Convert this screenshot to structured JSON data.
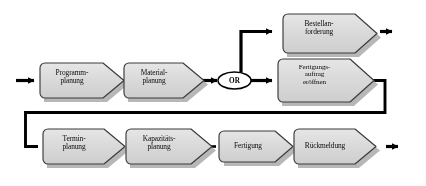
{
  "diagram": {
    "type": "process-flow-chart",
    "language": "de",
    "colors": {
      "box_fill": "#d6d6d6",
      "box_fill_top": "#e4e4e4",
      "box_border": "#3a3a3a",
      "shadow": "#aaaaaa",
      "line": "#000000",
      "text": "#0b0b0b",
      "background": "#ffffff"
    },
    "rows": {
      "top": {
        "steps": [
          {
            "id": "bestellanforderung",
            "label": "Bestellan-\nforderung",
            "lines": 2
          }
        ]
      },
      "middle": {
        "steps": [
          {
            "id": "programmplanung",
            "label": "Programm-\nplanung",
            "lines": 2
          },
          {
            "id": "materialplanung",
            "label": "Material-\nplanung",
            "lines": 2
          },
          {
            "id": "fertigungsauftrag",
            "label": "Fertigungs-\nauftrag\neröffnen",
            "lines": 3
          }
        ]
      },
      "bottom": {
        "steps": [
          {
            "id": "terminplanung",
            "label": "Termin-\nplanung",
            "lines": 2
          },
          {
            "id": "kapazitaetsplanung",
            "label": "Kapazitäts-\nplanung",
            "lines": 2
          },
          {
            "id": "fertigung",
            "label": "Fertigung",
            "lines": 1
          },
          {
            "id": "rueckmeldung",
            "label": "Rückmeldung",
            "lines": 1
          }
        ]
      }
    },
    "connectors": [
      {
        "id": "or-gate",
        "label": "OR",
        "shape": "ellipse"
      }
    ],
    "arrows": [
      {
        "id": "input-arrow",
        "name": "process-start-arrow"
      },
      {
        "id": "or-to-bestellanforderung",
        "name": "branch-up-arrow"
      },
      {
        "id": "or-to-fertigungsauftrag",
        "name": "branch-right-arrow"
      },
      {
        "id": "bestellanforderung-out",
        "name": "process-exit-arrow-top"
      },
      {
        "id": "rueckmeldung-out",
        "name": "process-exit-arrow-bottom"
      },
      {
        "id": "feedback-loop",
        "name": "loop-back-connector"
      }
    ]
  }
}
